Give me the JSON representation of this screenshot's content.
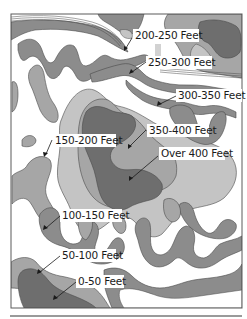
{
  "map": {
    "type": "topographic elevation map",
    "colors": {
      "background": "#ffffff",
      "frame": "#5a5a5a",
      "band_light": "#c4c4c4",
      "band_mid": "#a6a6a6",
      "band_dark": "#8c8c8c",
      "band_darkest": "#6e6e6e",
      "outline": "#4a4a4a",
      "label_text": "#1a1a1a"
    },
    "labels": [
      {
        "id": "200-250",
        "text": "200-250 Feet"
      },
      {
        "id": "250-300",
        "text": "250-300 Feet"
      },
      {
        "id": "300-350",
        "text": "300-350 Feet"
      },
      {
        "id": "350-400",
        "text": "350-400 Feet"
      },
      {
        "id": "over-400",
        "text": "Over 400 Feet"
      },
      {
        "id": "150-200",
        "text": "150-200 Feet"
      },
      {
        "id": "100-150",
        "text": "100-150 Feet"
      },
      {
        "id": "50-100",
        "text": "50-100 Feet"
      },
      {
        "id": "0-50",
        "text": "0-50 Feet"
      }
    ]
  }
}
